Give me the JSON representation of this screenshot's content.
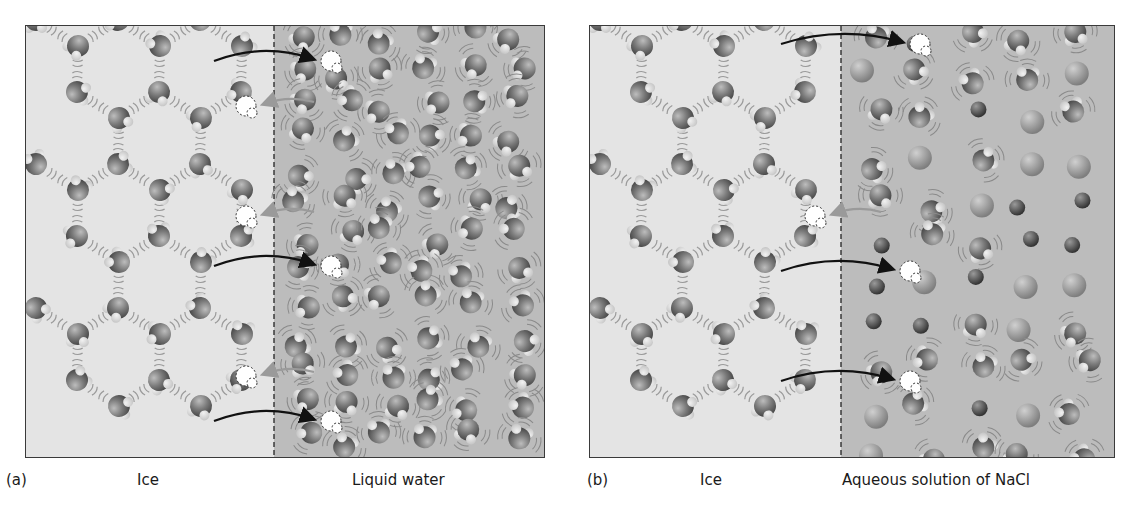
{
  "figure": {
    "panels": [
      {
        "id": "a",
        "label": "(a)",
        "left_region_label": "Ice",
        "right_region_label": "Liquid water",
        "left_region_color": "#e4e4e4",
        "right_region_color": "#bcbcbc"
      },
      {
        "id": "b",
        "label": "(b)",
        "left_region_label": "Ice",
        "right_region_label": "Aqueous solution of NaCl",
        "left_region_color": "#e4e4e4",
        "right_region_color": "#bcbcbc"
      }
    ],
    "colors": {
      "frame": "#3a3a3a",
      "oxygen": "#7a7a7a",
      "hydrogen": "#c8c8c8",
      "ion_large": "#8e8e8e",
      "ion_small": "#555555",
      "arrow_freeze": "#9a9a9a",
      "arrow_melt": "#111111",
      "vacancy": "#ffffff"
    },
    "legend_notes": {
      "black_arrow": "molecule leaving ice (melting)",
      "gray_arrow": "molecule joining ice (freezing)",
      "dashed_outline": "vacated / arriving lattice site"
    }
  }
}
